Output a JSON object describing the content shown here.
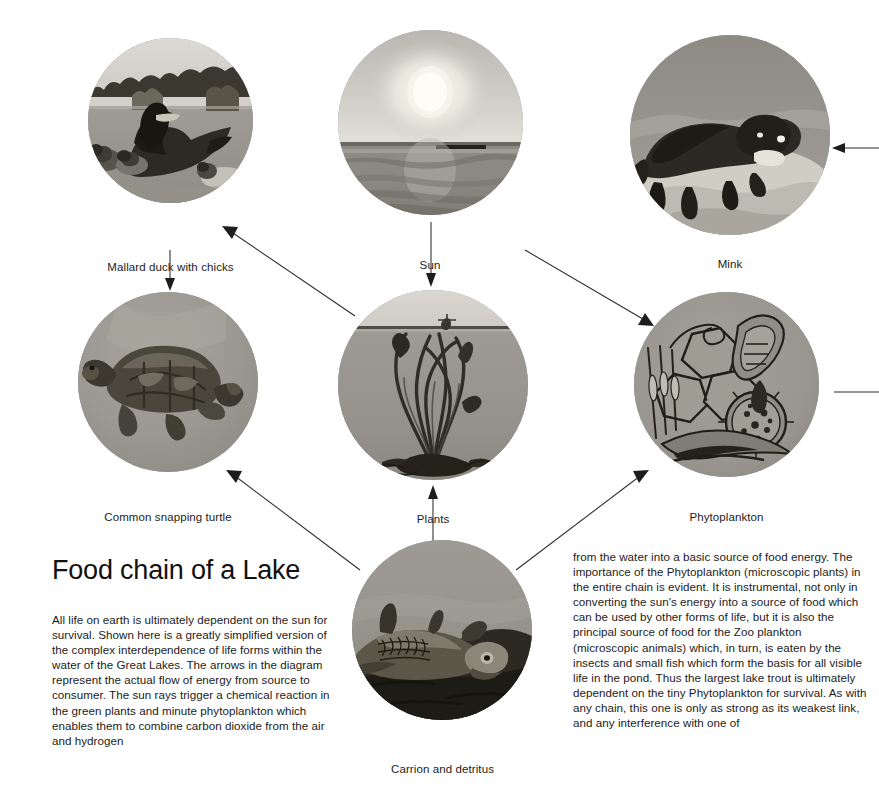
{
  "document": {
    "title": "Food chain of a Lake",
    "background_color": "#ffffff",
    "ink_color": "#1b1b1b"
  },
  "title": "Food chain of a Lake",
  "columns": {
    "left": "All life on earth is ultimately dependent on the sun for survival. Shown here is a greatly simplified version of the complex interdependence of life forms within the water of the Great Lakes. The arrows in the diagram represent the actual flow of energy from source to consumer. The sun rays trigger a chemical reaction in the green plants and minute phytoplankton which enables them to combine carbon dioxide from the air and hydrogen",
    "right": "from the water into a basic source of food energy. The importance of the Phytoplankton (microscopic plants) in the entire chain is evident. It is instrumental, not only in converting the sun's energy into a source of food which can be used by other forms of life, but it is also the principal source of food for the Zoo plankton (microscopic animals) which, in turn, is eaten by the insects and small fish which form the basis for all visible life in the pond. Thus the largest lake trout is ultimately dependent on the tiny Phytoplankton for survival. As with any chain, this one is only as strong as its weakest link, and any interference with one of"
  },
  "nodes": [
    {
      "id": "mallard",
      "caption": "Mallard duck with chicks",
      "icon": "duck-illustration"
    },
    {
      "id": "sun",
      "caption": "Sun",
      "icon": "sun-illustration"
    },
    {
      "id": "mink",
      "caption": "Mink",
      "icon": "mink-illustration"
    },
    {
      "id": "turtle",
      "caption": "Common snapping turtle",
      "icon": "turtle-illustration"
    },
    {
      "id": "plants",
      "caption": "Plants",
      "icon": "plants-illustration"
    },
    {
      "id": "phytoplankton",
      "caption": "Phytoplankton",
      "icon": "phytoplankton-illustration"
    },
    {
      "id": "carrion",
      "caption": "Carrion and detritus",
      "icon": "carrion-illustration"
    }
  ],
  "flows": [
    {
      "from": "plants",
      "to": "mallard",
      "label": ""
    },
    {
      "from": "mallard",
      "to": "turtle",
      "label": ""
    },
    {
      "from": "sun",
      "to": "plants",
      "label": ""
    },
    {
      "from": "sun",
      "to": "phytoplankton",
      "label": ""
    },
    {
      "from": "carrion",
      "to": "plants",
      "label": ""
    },
    {
      "from": "carrion",
      "to": "turtle",
      "label": ""
    },
    {
      "from": "carrion",
      "to": "phytoplankton",
      "label": ""
    },
    {
      "from": "offpage",
      "to": "mink",
      "label": ""
    },
    {
      "from": "phytoplankton",
      "to": "offpage",
      "label": ""
    }
  ]
}
